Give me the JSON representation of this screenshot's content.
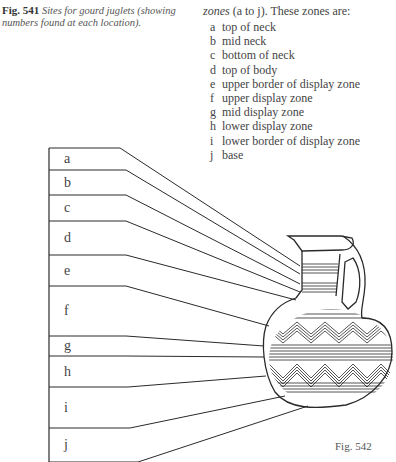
{
  "caption": {
    "figure_number": "Fig. 541",
    "text": "Sites for gourd juglets (showing numbers found at each location)."
  },
  "intro": {
    "emphasis": "zones",
    "rest": " (a to j). These zones are:"
  },
  "zones": [
    {
      "letter": "a",
      "description": "top of neck"
    },
    {
      "letter": "b",
      "description": "mid neck"
    },
    {
      "letter": "c",
      "description": "bottom of neck"
    },
    {
      "letter": "d",
      "description": "top of body"
    },
    {
      "letter": "e",
      "description": "upper border of display zone"
    },
    {
      "letter": "f",
      "description": "upper display zone"
    },
    {
      "letter": "g",
      "description": "mid display zone"
    },
    {
      "letter": "h",
      "description": "lower display zone"
    },
    {
      "letter": "i",
      "description": "lower border of display zone"
    },
    {
      "letter": "j",
      "description": "base"
    }
  ],
  "diagram": {
    "figure_label": "Fig. 542",
    "subject": "gourd juglet",
    "ink_color": "#2a2a2a"
  }
}
